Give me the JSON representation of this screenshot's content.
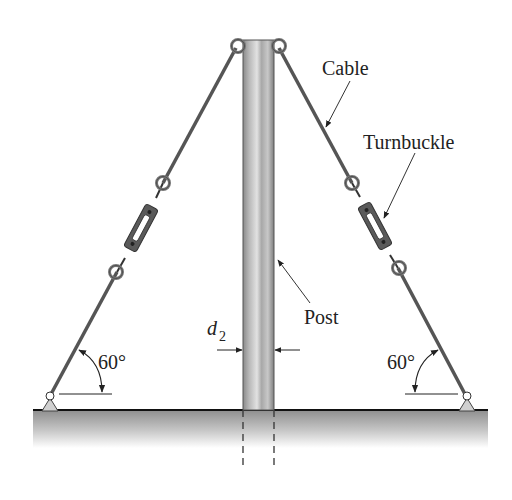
{
  "diagram": {
    "labels": {
      "cable": "Cable",
      "turnbuckle": "Turnbuckle",
      "post": "Post",
      "diameter_symbol": "d",
      "diameter_subscript": "2",
      "angle_left": "60°",
      "angle_right": "60°"
    },
    "colors": {
      "cable": "#555555",
      "post_dark": "#7a7a7a",
      "post_light": "#d8d8d8",
      "ground_top": "#9a9a9a",
      "ground_bottom": "#ffffff",
      "support": "#d0d0d0",
      "text": "#222222"
    }
  }
}
